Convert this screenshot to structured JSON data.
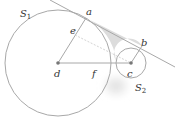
{
  "diagram": {
    "circles": [
      {
        "id": "S1",
        "label": "S",
        "subscript": "1",
        "cx": 58,
        "cy": 63,
        "r": 53
      },
      {
        "id": "S2",
        "label": "S",
        "subscript": "2",
        "cx": 131,
        "cy": 63,
        "r": 15
      }
    ],
    "points": {
      "a": {
        "label": "a",
        "x": 86,
        "y": 18
      },
      "b": {
        "label": "b",
        "x": 142,
        "y": 46
      },
      "c": {
        "label": "c",
        "x": 131,
        "y": 63
      },
      "d": {
        "label": "d",
        "x": 58,
        "y": 63
      },
      "e": {
        "label": "e",
        "x": 75,
        "y": 35
      },
      "f": {
        "label": "f",
        "x": 96,
        "y": 63
      }
    },
    "labels": {
      "a": "a",
      "b": "b",
      "c": "c",
      "d": "d",
      "e": "e",
      "f": "f",
      "s1_main": "S",
      "s1_sub": "1",
      "s2_main": "S",
      "s2_sub": "2"
    },
    "colors": {
      "stroke": "#a8a8a8",
      "dashed": "#c8c8c8",
      "shade": "#dcdcdc",
      "point": "#777777",
      "text": "#333333"
    }
  }
}
